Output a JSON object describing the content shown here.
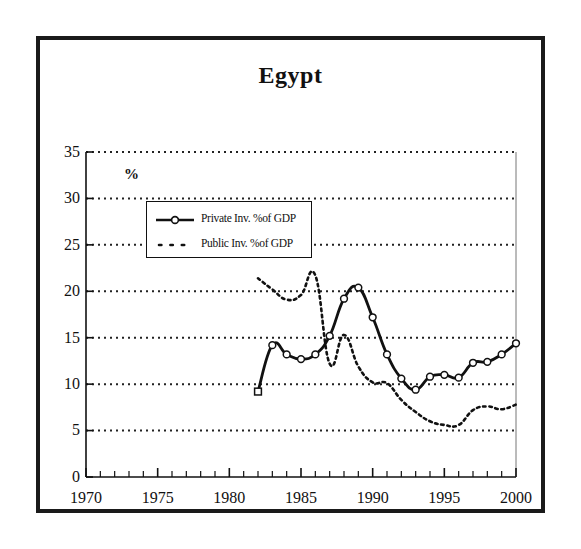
{
  "figure": {
    "title": "Egypt",
    "y_axis_unit": "%"
  },
  "legend": {
    "items": [
      {
        "label": "Private Inv. %of GDP",
        "marker": "line-with-open-circle-marker",
        "style": "solid"
      },
      {
        "label": "Public Inv. %of GDP",
        "marker": "dotted-line",
        "style": "dotted"
      }
    ]
  },
  "axes": {
    "y_ticks": [
      "0",
      "5",
      "10",
      "15",
      "20",
      "25",
      "30",
      "35"
    ],
    "x_ticks": [
      "1970",
      "1975",
      "1980",
      "1985",
      "1990",
      "1995",
      "2000"
    ]
  },
  "colors": {
    "frame": "#1a1a1a",
    "series_private": "#111111",
    "series_public": "#111111",
    "gridline": "#222222",
    "background": "#ffffff"
  },
  "chart_data": {
    "type": "line",
    "title": "Egypt",
    "xlabel": "",
    "ylabel": "%",
    "xlim": [
      1970,
      2000
    ],
    "ylim": [
      0,
      35
    ],
    "y_ticks": [
      0,
      5,
      10,
      15,
      20,
      25,
      30,
      35
    ],
    "x_ticks": [
      1970,
      1975,
      1980,
      1985,
      1990,
      1995,
      2000
    ],
    "x_minor_tick_step": 1,
    "grid": "horizontal-dotted",
    "legend_position": "upper-left-inside",
    "x": [
      1982,
      1983,
      1984,
      1985,
      1986,
      1987,
      1988,
      1989,
      1990,
      1991,
      1992,
      1993,
      1994,
      1995,
      1996,
      1997,
      1998,
      1999,
      2000
    ],
    "series": [
      {
        "name": "Private Inv. %of GDP",
        "style": "solid-with-open-square-and-circle-markers",
        "values": [
          9.2,
          14.2,
          13.2,
          12.7,
          13.2,
          15.2,
          19.2,
          20.4,
          17.2,
          13.2,
          10.6,
          9.4,
          10.8,
          11.0,
          10.7,
          12.3,
          12.4,
          13.2,
          14.4
        ]
      },
      {
        "name": "Public Inv. %of GDP",
        "style": "dotted",
        "values": [
          21.4,
          20.2,
          19.1,
          19.6,
          21.7,
          12.2,
          15.3,
          11.9,
          10.2,
          10.1,
          8.3,
          7.0,
          6.0,
          5.6,
          5.6,
          7.2,
          7.6,
          7.3,
          7.8
        ]
      }
    ]
  }
}
